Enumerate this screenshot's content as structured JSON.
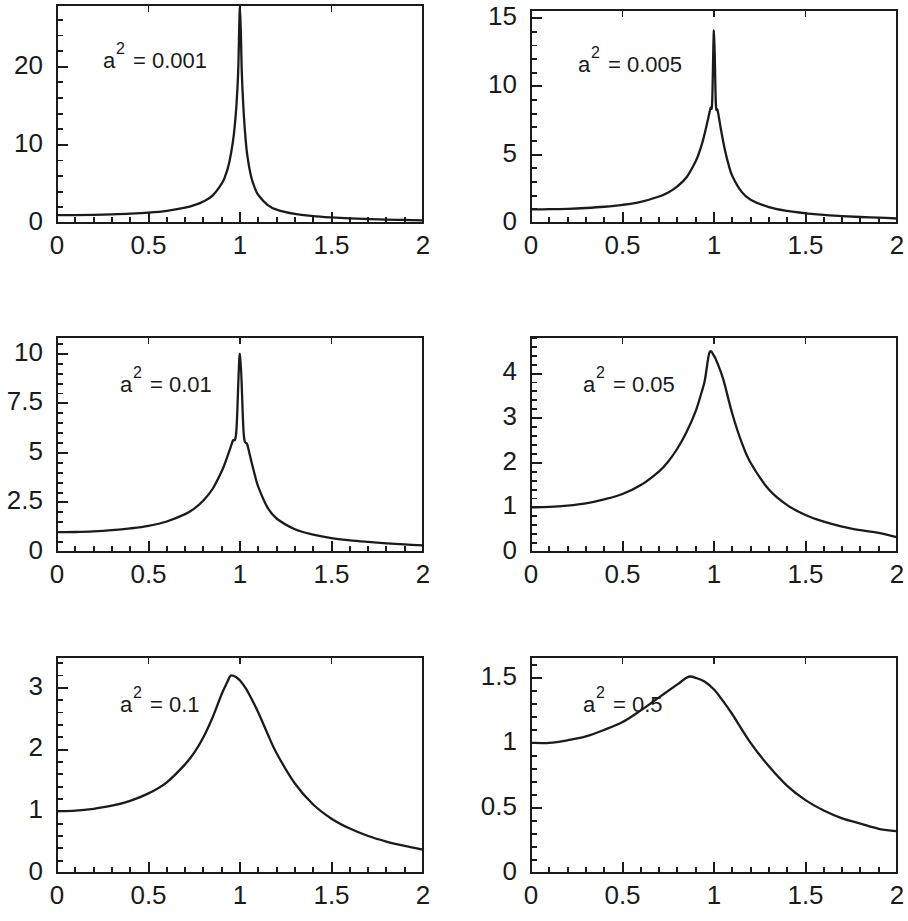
{
  "figure": {
    "width": 908,
    "height": 921,
    "background": "#ffffff",
    "line_color": "#1b1b1b",
    "panel_count": 6,
    "layout": "2 columns x 3 rows"
  },
  "chart_data": [
    {
      "type": "line",
      "title": "",
      "annotation": "a² = 0.001",
      "annotation_base": "a",
      "annotation_sup": "2",
      "annotation_rest": "= 0.001",
      "parameter_name": "a^2",
      "parameter_value": 0.001,
      "xlabel": "",
      "ylabel": "",
      "xlim": [
        0,
        2
      ],
      "ylim": [
        0,
        27.9
      ],
      "grid": false,
      "legend": "none",
      "x_major_ticks": [
        0,
        0.5,
        1,
        1.5,
        2
      ],
      "x_tick_labels": [
        "0",
        "0.5",
        "1",
        "1.5",
        "2"
      ],
      "x_minor_step": 0.1,
      "y_major_ticks": [
        0,
        10,
        20
      ],
      "y_tick_labels": [
        "0",
        "10",
        "20"
      ],
      "y_minor_step": 2,
      "peak": {
        "x": 1.0,
        "y": 27.6
      },
      "value_at_0": 1.0,
      "value_at_2": 0.33,
      "series": [
        {
          "name": "resonance",
          "x": [
            0,
            0.1,
            0.2,
            0.3,
            0.4,
            0.5,
            0.6,
            0.7,
            0.75,
            0.8,
            0.85,
            0.9,
            0.92,
            0.94,
            0.96,
            0.97,
            0.98,
            0.99,
            1.0,
            1.01,
            1.02,
            1.03,
            1.04,
            1.06,
            1.08,
            1.1,
            1.15,
            1.2,
            1.3,
            1.4,
            1.5,
            1.6,
            1.7,
            1.8,
            1.9,
            2.0
          ],
          "y": [
            1.0,
            1.01,
            1.04,
            1.1,
            1.19,
            1.33,
            1.56,
            1.96,
            2.28,
            2.76,
            3.5,
            5.03,
            6.05,
            7.6,
            10.2,
            12.1,
            14.9,
            19.3,
            27.6,
            19.2,
            14.2,
            10.9,
            8.66,
            6.01,
            4.53,
            3.59,
            2.33,
            1.72,
            1.16,
            0.88,
            0.71,
            0.59,
            0.51,
            0.44,
            0.39,
            0.33
          ]
        }
      ]
    },
    {
      "type": "line",
      "title": "",
      "annotation": "a² = 0.005",
      "annotation_base": "a",
      "annotation_sup": "2",
      "annotation_rest": "= 0.005",
      "parameter_name": "a^2",
      "parameter_value": 0.005,
      "xlabel": "",
      "ylabel": "",
      "xlim": [
        0,
        2
      ],
      "ylim": [
        0,
        15.6
      ],
      "grid": false,
      "legend": "none",
      "x_major_ticks": [
        0,
        0.5,
        1,
        1.5,
        2
      ],
      "x_tick_labels": [
        "0",
        "0.5",
        "1",
        "1.5",
        "2"
      ],
      "x_minor_step": 0.1,
      "y_major_ticks": [
        0,
        5,
        10,
        15
      ],
      "y_tick_labels": [
        "0",
        "5",
        "10",
        "15"
      ],
      "y_minor_step": 1,
      "peak": {
        "x": 1.0,
        "y": 14.1
      },
      "value_at_0": 1.0,
      "value_at_2": 0.33,
      "series": [
        {
          "name": "resonance",
          "x": [
            0,
            0.1,
            0.2,
            0.3,
            0.4,
            0.5,
            0.6,
            0.7,
            0.75,
            0.8,
            0.85,
            0.9,
            0.92,
            0.94,
            0.96,
            0.98,
            0.99,
            1.0,
            1.01,
            1.02,
            1.04,
            1.06,
            1.08,
            1.1,
            1.15,
            1.2,
            1.3,
            1.4,
            1.5,
            1.6,
            1.7,
            1.8,
            1.9,
            2.0
          ],
          "y": [
            1.0,
            1.01,
            1.04,
            1.1,
            1.19,
            1.33,
            1.55,
            1.94,
            2.24,
            2.69,
            3.35,
            4.53,
            5.2,
            6.07,
            7.17,
            8.37,
            8.86,
            14.1,
            8.78,
            8.25,
            6.7,
            5.33,
            4.26,
            3.45,
            2.3,
            1.71,
            1.16,
            0.88,
            0.71,
            0.59,
            0.51,
            0.44,
            0.39,
            0.33
          ]
        }
      ]
    },
    {
      "type": "line",
      "title": "",
      "annotation": "a² = 0.01",
      "annotation_base": "a",
      "annotation_sup": "2",
      "annotation_rest": "= 0.01",
      "parameter_name": "a^2",
      "parameter_value": 0.01,
      "xlabel": "",
      "ylabel": "",
      "xlim": [
        0,
        2
      ],
      "ylim": [
        0,
        10.85
      ],
      "grid": false,
      "legend": "none",
      "x_major_ticks": [
        0,
        0.5,
        1,
        1.5,
        2
      ],
      "x_tick_labels": [
        "0",
        "0.5",
        "1",
        "1.5",
        "2"
      ],
      "x_minor_step": 0.1,
      "y_major_ticks": [
        0,
        2.5,
        5,
        7.5,
        10
      ],
      "y_tick_labels": [
        "0",
        "2.5",
        "5",
        "7.5",
        "10"
      ],
      "y_minor_step": 0.5,
      "peak": {
        "x": 1.0,
        "y": 10.0
      },
      "value_at_0": 1.0,
      "value_at_2": 0.33,
      "series": [
        {
          "name": "resonance",
          "x": [
            0,
            0.1,
            0.2,
            0.3,
            0.4,
            0.5,
            0.6,
            0.7,
            0.75,
            0.8,
            0.85,
            0.9,
            0.92,
            0.94,
            0.96,
            0.98,
            1.0,
            1.02,
            1.04,
            1.06,
            1.08,
            1.1,
            1.15,
            1.2,
            1.3,
            1.4,
            1.5,
            1.6,
            1.7,
            1.8,
            1.9,
            2.0
          ],
          "y": [
            1.0,
            1.01,
            1.04,
            1.1,
            1.19,
            1.32,
            1.54,
            1.91,
            2.19,
            2.6,
            3.18,
            4.08,
            4.53,
            5.05,
            5.6,
            6.1,
            10.0,
            6.0,
            5.42,
            4.65,
            3.92,
            3.29,
            2.25,
            1.69,
            1.15,
            0.88,
            0.7,
            0.59,
            0.51,
            0.44,
            0.38,
            0.33
          ]
        }
      ]
    },
    {
      "type": "line",
      "title": "",
      "annotation": "a² = 0.05",
      "annotation_base": "a",
      "annotation_sup": "2",
      "annotation_rest": "= 0.05",
      "parameter_name": "a^2",
      "parameter_value": 0.05,
      "xlabel": "",
      "ylabel": "",
      "xlim": [
        0,
        2
      ],
      "ylim": [
        0,
        4.82
      ],
      "grid": false,
      "legend": "none",
      "x_major_ticks": [
        0,
        0.5,
        1,
        1.5,
        2
      ],
      "x_tick_labels": [
        "0",
        "0.5",
        "1",
        "1.5",
        "2"
      ],
      "x_minor_step": 0.1,
      "y_major_ticks": [
        0,
        1,
        2,
        3,
        4
      ],
      "y_tick_labels": [
        "0",
        "1",
        "2",
        "3",
        "4"
      ],
      "y_minor_step": 0.2,
      "peak": {
        "x": 0.975,
        "y": 4.47
      },
      "value_at_0": 1.0,
      "value_at_2": 0.33,
      "series": [
        {
          "name": "resonance",
          "x": [
            0,
            0.1,
            0.2,
            0.3,
            0.4,
            0.5,
            0.6,
            0.7,
            0.75,
            0.8,
            0.85,
            0.9,
            0.93,
            0.95,
            0.975,
            1.0,
            1.02,
            1.05,
            1.1,
            1.15,
            1.2,
            1.3,
            1.4,
            1.5,
            1.6,
            1.7,
            1.8,
            1.9,
            2.0
          ],
          "y": [
            1.0,
            1.01,
            1.04,
            1.09,
            1.18,
            1.3,
            1.5,
            1.81,
            2.03,
            2.32,
            2.69,
            3.16,
            3.55,
            3.85,
            4.47,
            4.4,
            4.22,
            3.88,
            3.1,
            2.47,
            2.0,
            1.4,
            1.05,
            0.83,
            0.68,
            0.57,
            0.49,
            0.43,
            0.33
          ]
        }
      ]
    },
    {
      "type": "line",
      "title": "",
      "annotation": "a² = 0.1",
      "annotation_base": "a",
      "annotation_sup": "2",
      "annotation_rest": "= 0.1",
      "parameter_name": "a^2",
      "parameter_value": 0.1,
      "xlabel": "",
      "ylabel": "",
      "xlim": [
        0,
        2
      ],
      "ylim": [
        0,
        3.5
      ],
      "grid": false,
      "legend": "none",
      "x_major_ticks": [
        0,
        0.5,
        1,
        1.5,
        2
      ],
      "x_tick_labels": [
        "0",
        "0.5",
        "1",
        "1.5",
        "2"
      ],
      "x_minor_step": 0.1,
      "y_major_ticks": [
        0,
        1,
        2,
        3
      ],
      "y_tick_labels": [
        "0",
        "1",
        "2",
        "3"
      ],
      "y_minor_step": 0.2,
      "peak": {
        "x": 0.95,
        "y": 3.2
      },
      "value_at_0": 1.0,
      "value_at_2": 0.33,
      "series": [
        {
          "name": "resonance",
          "x": [
            0,
            0.1,
            0.2,
            0.3,
            0.4,
            0.5,
            0.6,
            0.7,
            0.75,
            0.8,
            0.85,
            0.9,
            0.93,
            0.95,
            0.98,
            1.0,
            1.03,
            1.06,
            1.1,
            1.15,
            1.2,
            1.3,
            1.4,
            1.5,
            1.6,
            1.7,
            1.8,
            1.9,
            2.0
          ],
          "y": [
            1.0,
            1.01,
            1.04,
            1.09,
            1.17,
            1.29,
            1.47,
            1.76,
            1.95,
            2.2,
            2.52,
            2.9,
            3.09,
            3.2,
            3.17,
            3.12,
            3.0,
            2.84,
            2.6,
            2.26,
            1.94,
            1.45,
            1.11,
            0.88,
            0.72,
            0.6,
            0.51,
            0.44,
            0.38
          ]
        }
      ]
    },
    {
      "type": "line",
      "title": "",
      "annotation": "a² = 0.5",
      "annotation_base": "a",
      "annotation_sup": "2",
      "annotation_rest": "= 0.5",
      "parameter_name": "a^2",
      "parameter_value": 0.5,
      "xlabel": "",
      "ylabel": "",
      "xlim": [
        0,
        2
      ],
      "ylim": [
        0,
        1.66
      ],
      "grid": false,
      "legend": "none",
      "x_major_ticks": [
        0,
        0.5,
        1,
        1.5,
        2
      ],
      "x_tick_labels": [
        "0",
        "0.5",
        "1",
        "1.5",
        "2"
      ],
      "x_minor_step": 0.1,
      "y_major_ticks": [
        0,
        0.5,
        1,
        1.5
      ],
      "y_tick_labels": [
        "0",
        "0.5",
        "1",
        "1.5"
      ],
      "y_minor_step": 0.1,
      "peak": {
        "x": 0.87,
        "y": 1.51
      },
      "value_at_0": 1.0,
      "value_at_2": 0.32,
      "series": [
        {
          "name": "resonance",
          "x": [
            0,
            0.1,
            0.2,
            0.3,
            0.4,
            0.5,
            0.6,
            0.7,
            0.75,
            0.8,
            0.85,
            0.87,
            0.9,
            0.95,
            1.0,
            1.05,
            1.1,
            1.2,
            1.3,
            1.4,
            1.5,
            1.6,
            1.7,
            1.8,
            1.9,
            2.0
          ],
          "y": [
            1.0,
            1.0,
            1.02,
            1.05,
            1.1,
            1.16,
            1.25,
            1.35,
            1.4,
            1.45,
            1.5,
            1.51,
            1.5,
            1.47,
            1.41,
            1.32,
            1.22,
            1.0,
            0.82,
            0.67,
            0.56,
            0.48,
            0.42,
            0.38,
            0.34,
            0.32
          ]
        }
      ]
    }
  ]
}
